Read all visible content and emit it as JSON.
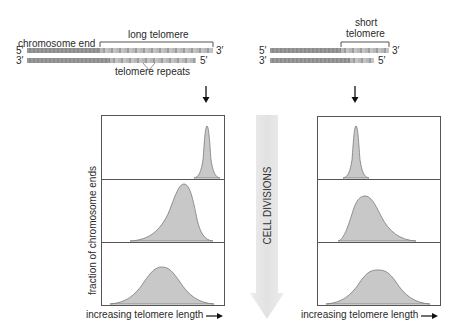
{
  "left": {
    "chromosome_end_label": "chromosome end",
    "telomere_label": "long telomere",
    "repeats_label": "telomere repeats",
    "top_strand_left": "5′",
    "top_strand_right": "3′",
    "bottom_strand_left": "3′",
    "bottom_strand_right": "5′",
    "y_axis_label": "fraction of chromosome ends",
    "x_axis_label": "increasing telomere length"
  },
  "right": {
    "telomere_label_line1": "short",
    "telomere_label_line2": "telomere",
    "top_strand_left": "5′",
    "top_strand_right": "3′",
    "bottom_strand_left": "3′",
    "bottom_strand_right": "5′",
    "x_axis_label": "increasing telomere length"
  },
  "center": {
    "arrow_label": "CELL DIVISIONS"
  },
  "icons": {
    "down_arrow": "down-arrow-icon",
    "right_arrow": "right-arrow-icon"
  },
  "colors": {
    "curve_fill": "#c8c8c8",
    "curve_stroke": "#7a7a7a",
    "panel_border": "#555555",
    "big_arrow": "#e6e6e6"
  },
  "distributions": {
    "left": [
      {
        "stage": 1,
        "peak_x_fraction": 0.87,
        "width": "narrow"
      },
      {
        "stage": 2,
        "peak_x_fraction": 0.67,
        "width": "medium, skewed"
      },
      {
        "stage": 3,
        "peak_x_fraction": 0.49,
        "width": "wide"
      }
    ],
    "right": [
      {
        "stage": 1,
        "peak_x_fraction": 0.31,
        "width": "narrow"
      },
      {
        "stage": 2,
        "peak_x_fraction": 0.4,
        "width": "medium, skewed"
      },
      {
        "stage": 3,
        "peak_x_fraction": 0.5,
        "width": "wide"
      }
    ]
  }
}
